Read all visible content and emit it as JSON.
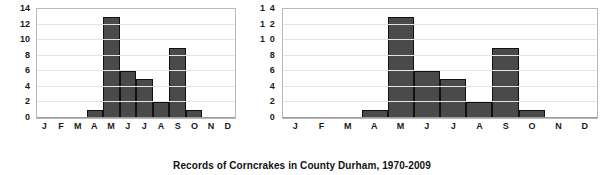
{
  "caption": "Records of Corncrakes in County Durham, 1970-2009",
  "colors": {
    "bar_fill": "#4a4a4a",
    "bar_outline": "#111111",
    "plot_border": "#b9b9b9",
    "gridline": "#e4e4e4",
    "background": "#ffffff",
    "text": "#1a1a1a"
  },
  "chart_data": [
    {
      "type": "bar",
      "name": "corncrake-records-left",
      "title": "",
      "xlabel": "",
      "ylabel": "",
      "categories": [
        "J",
        "F",
        "M",
        "A",
        "M",
        "J",
        "J",
        "A",
        "S",
        "O",
        "N",
        "D"
      ],
      "values": [
        0,
        0,
        0,
        1,
        13,
        6,
        5,
        2,
        9,
        1,
        0,
        0
      ],
      "ylim": [
        0,
        14
      ],
      "yticks": [
        0,
        2,
        4,
        6,
        8,
        10,
        12,
        14
      ],
      "ytick_labels": [
        "0",
        "2",
        "4",
        "6",
        "8",
        "10",
        "12",
        "14"
      ],
      "grid": true,
      "legend": null
    },
    {
      "type": "bar",
      "name": "corncrake-records-right",
      "title": "",
      "xlabel": "",
      "ylabel": "",
      "categories": [
        "J",
        "F",
        "M",
        "A",
        "M",
        "J",
        "J",
        "A",
        "S",
        "O",
        "N",
        "D"
      ],
      "values": [
        0,
        0,
        0,
        1,
        13,
        6,
        5,
        2,
        9,
        1,
        0,
        0
      ],
      "ylim": [
        0,
        14
      ],
      "yticks": [
        0,
        2,
        4,
        6,
        8,
        10,
        12,
        14
      ],
      "ytick_labels": [
        "0",
        "2",
        "4",
        "6",
        "8",
        "1 0",
        "1 2",
        "1 4"
      ],
      "grid": true,
      "legend": null
    }
  ]
}
